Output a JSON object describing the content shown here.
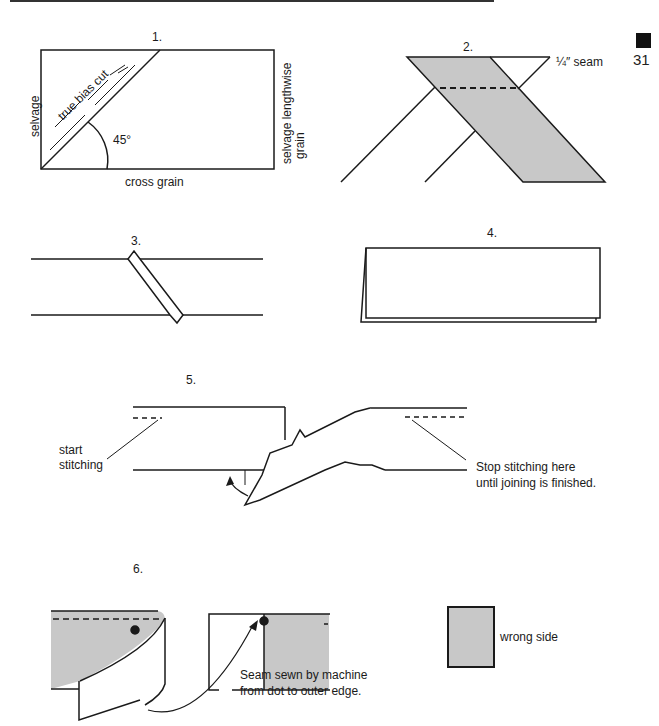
{
  "page": {
    "number": "31"
  },
  "steps": [
    {
      "id": 1,
      "label": "1.",
      "annotations": {
        "bias": "true bias cut",
        "selvage_left": "selvage",
        "selvage_right_1": "selvage lengthwise",
        "selvage_right_2": "grain",
        "angle": "45°",
        "bottom": "cross grain"
      }
    },
    {
      "id": 2,
      "label": "2.",
      "annotations": {
        "seam": "¼″ seam"
      }
    },
    {
      "id": 3,
      "label": "3."
    },
    {
      "id": 4,
      "label": "4."
    },
    {
      "id": 5,
      "label": "5.",
      "annotations": {
        "start_1": "start",
        "start_2": "stitching",
        "stop_1": "Stop stitching here",
        "stop_2": "until joining is finished."
      }
    },
    {
      "id": 6,
      "label": "6.",
      "annotations": {
        "seam_1": "Seam sewn by machine",
        "seam_2": "from dot to outer edge."
      }
    }
  ],
  "legend": {
    "label": "wrong side",
    "swatch_color": "#c8c8c8"
  },
  "colors": {
    "fabric_wrong_side": "#c8c8c8",
    "line": "#1a1a1a"
  }
}
